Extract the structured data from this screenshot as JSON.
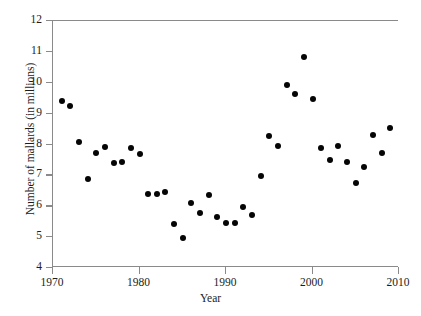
{
  "chart_data": {
    "type": "scatter",
    "title": "",
    "xlabel": "Year",
    "ylabel": "Number of mallards (in millions)",
    "xlim": [
      1970,
      2010
    ],
    "ylim": [
      4,
      12
    ],
    "xticks": [
      1970,
      1980,
      1990,
      2000,
      2010
    ],
    "xtick_labels": [
      "1970",
      "1980",
      "1990",
      "2000",
      "2010"
    ],
    "yticks": [
      4,
      5,
      6,
      7,
      8,
      9,
      10,
      11,
      12
    ],
    "ytick_labels": [
      "4",
      "5",
      "6",
      "7",
      "8",
      "9",
      "10",
      "11",
      "12"
    ],
    "grid": false,
    "legend": "none",
    "marker": "filled-circle",
    "marker_color": "#050505",
    "axis_color": "#8a8a8a",
    "x": [
      1971,
      1972,
      1973,
      1974,
      1975,
      1976,
      1977,
      1978,
      1979,
      1980,
      1981,
      1982,
      1983,
      1984,
      1985,
      1986,
      1987,
      1988,
      1989,
      1990,
      1991,
      1992,
      1993,
      1994,
      1995,
      1996,
      1997,
      1998,
      1999,
      2000,
      2001,
      2002,
      2003,
      2004,
      2005,
      2006,
      2007,
      2008,
      2009
    ],
    "y": [
      9.42,
      9.26,
      8.08,
      6.88,
      7.72,
      7.93,
      7.39,
      7.42,
      7.88,
      7.7,
      6.4,
      6.4,
      6.45,
      5.42,
      4.96,
      6.12,
      5.79,
      6.37,
      5.65,
      5.45,
      5.45,
      5.99,
      5.71,
      6.98,
      8.27,
      7.94,
      9.94,
      9.64,
      10.82,
      9.47,
      7.9,
      7.5,
      7.95,
      7.42,
      6.76,
      7.28,
      8.3,
      7.72,
      8.52
    ],
    "points": [
      {
        "year": 1971,
        "value": 9.42
      },
      {
        "year": 1972,
        "value": 9.26
      },
      {
        "year": 1973,
        "value": 8.08
      },
      {
        "year": 1974,
        "value": 6.88
      },
      {
        "year": 1975,
        "value": 7.72
      },
      {
        "year": 1976,
        "value": 7.93
      },
      {
        "year": 1977,
        "value": 7.39
      },
      {
        "year": 1978,
        "value": 7.42
      },
      {
        "year": 1979,
        "value": 7.88
      },
      {
        "year": 1980,
        "value": 7.7
      },
      {
        "year": 1981,
        "value": 6.4
      },
      {
        "year": 1982,
        "value": 6.4
      },
      {
        "year": 1983,
        "value": 6.45
      },
      {
        "year": 1984,
        "value": 5.42
      },
      {
        "year": 1985,
        "value": 4.96
      },
      {
        "year": 1986,
        "value": 6.12
      },
      {
        "year": 1987,
        "value": 5.79
      },
      {
        "year": 1988,
        "value": 6.37
      },
      {
        "year": 1989,
        "value": 5.65
      },
      {
        "year": 1990,
        "value": 5.45
      },
      {
        "year": 1991,
        "value": 5.45
      },
      {
        "year": 1992,
        "value": 5.99
      },
      {
        "year": 1993,
        "value": 5.71
      },
      {
        "year": 1994,
        "value": 6.98
      },
      {
        "year": 1995,
        "value": 8.27
      },
      {
        "year": 1996,
        "value": 7.94
      },
      {
        "year": 1997,
        "value": 9.94
      },
      {
        "year": 1998,
        "value": 9.64
      },
      {
        "year": 1999,
        "value": 10.82
      },
      {
        "year": 2000,
        "value": 9.47
      },
      {
        "year": 2001,
        "value": 7.9
      },
      {
        "year": 2002,
        "value": 7.5
      },
      {
        "year": 2003,
        "value": 7.95
      },
      {
        "year": 2004,
        "value": 7.42
      },
      {
        "year": 2005,
        "value": 6.76
      },
      {
        "year": 2006,
        "value": 7.28
      },
      {
        "year": 2007,
        "value": 8.3
      },
      {
        "year": 2008,
        "value": 7.72
      },
      {
        "year": 2009,
        "value": 8.52
      }
    ]
  }
}
